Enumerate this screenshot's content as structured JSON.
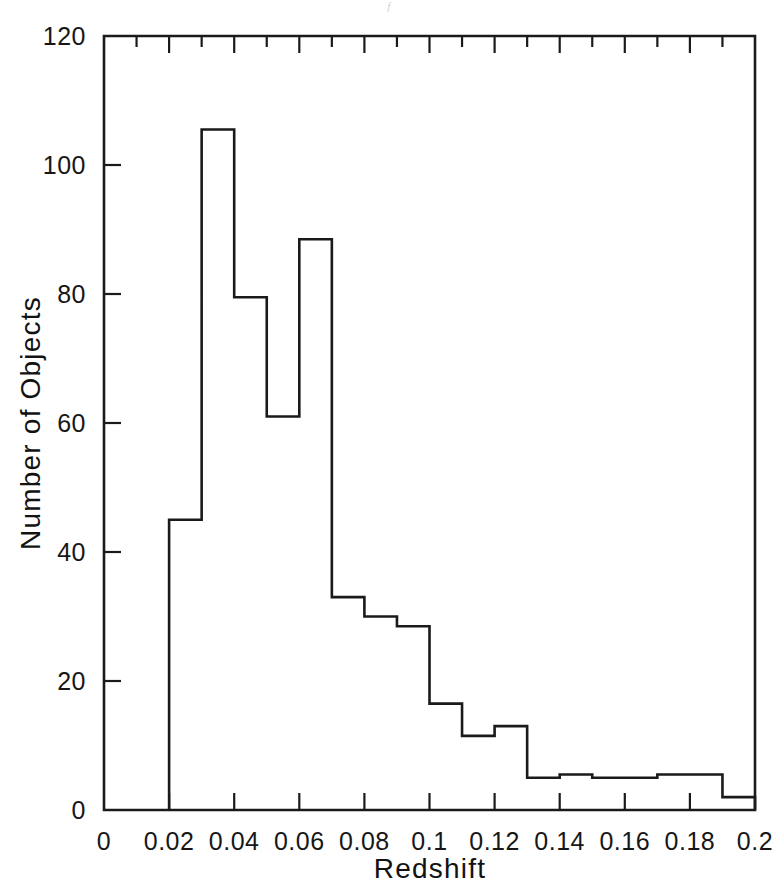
{
  "scan": {
    "header_fragment": "f"
  },
  "chart_data": {
    "type": "bar",
    "title": "",
    "subtitle": "",
    "xlabel": "Redshift",
    "ylabel": "Number of Objects",
    "xlim": [
      0,
      0.2
    ],
    "ylim": [
      0,
      120
    ],
    "grid": false,
    "legend": null,
    "bin_width": 0.01,
    "bin_edges": [
      0.02,
      0.03,
      0.04,
      0.05,
      0.06,
      0.07,
      0.08,
      0.09,
      0.1,
      0.11,
      0.12,
      0.13,
      0.14,
      0.15,
      0.16,
      0.17,
      0.18,
      0.19,
      0.2
    ],
    "categories": [
      "0.02-0.03",
      "0.03-0.04",
      "0.04-0.05",
      "0.05-0.06",
      "0.06-0.07",
      "0.07-0.08",
      "0.08-0.09",
      "0.09-0.10",
      "0.10-0.11",
      "0.11-0.12",
      "0.12-0.13",
      "0.13-0.14",
      "0.14-0.15",
      "0.15-0.16",
      "0.16-0.17",
      "0.17-0.18",
      "0.18-0.19",
      "0.19-0.20"
    ],
    "values": [
      45,
      105.5,
      79.5,
      61,
      88.5,
      33,
      30,
      28.5,
      16.5,
      11.5,
      13,
      5,
      5.5,
      5,
      5,
      5.5,
      5.5,
      2
    ],
    "x_ticks": [
      0,
      0.02,
      0.04,
      0.06,
      0.08,
      0.1,
      0.12,
      0.14,
      0.16,
      0.18,
      0.2
    ],
    "x_tick_labels": [
      "0",
      "0.02",
      "0.04",
      "0.06",
      "0.08",
      "0.1",
      "0.12",
      "0.14",
      "0.16",
      "0.18",
      "0.2"
    ],
    "x_minor_ticks": [
      0.01,
      0.03,
      0.05,
      0.07,
      0.09,
      0.11,
      0.13,
      0.15,
      0.17,
      0.19
    ],
    "y_ticks": [
      0,
      20,
      40,
      60,
      80,
      100,
      120
    ],
    "y_tick_labels": [
      "0",
      "20",
      "40",
      "60",
      "80",
      "100",
      "120"
    ],
    "line_color": "#1a1a1a",
    "background_color": "#ffffff"
  }
}
